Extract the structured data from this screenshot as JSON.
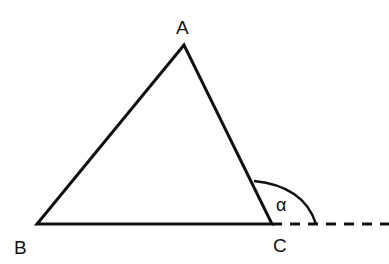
{
  "diagram": {
    "type": "triangle-exterior-angle",
    "vertices": {
      "A": {
        "label": "A",
        "x": 184,
        "y": 45
      },
      "B": {
        "label": "B",
        "x": 37,
        "y": 224
      },
      "C": {
        "label": "C",
        "x": 272,
        "y": 224
      }
    },
    "angle_label": "α",
    "extension": "dashed line extending BC beyond C",
    "colors": {
      "stroke": "#111111",
      "background": "#ffffff"
    }
  }
}
